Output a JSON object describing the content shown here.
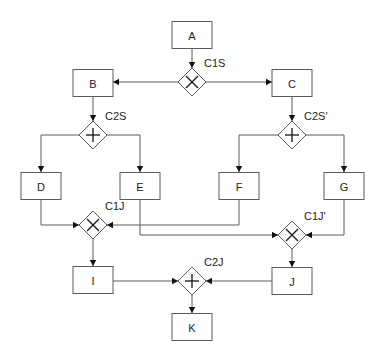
{
  "diagram": {
    "type": "process-flow",
    "colors": {
      "line": "#5a5a5a",
      "text": "#222222",
      "background": "#ffffff"
    },
    "tasks": [
      {
        "id": "A",
        "label": "A"
      },
      {
        "id": "B",
        "label": "B"
      },
      {
        "id": "C",
        "label": "C"
      },
      {
        "id": "D",
        "label": "D"
      },
      {
        "id": "E",
        "label": "E"
      },
      {
        "id": "F",
        "label": "F"
      },
      {
        "id": "G",
        "label": "G"
      },
      {
        "id": "I",
        "label": "I"
      },
      {
        "id": "J",
        "label": "J"
      },
      {
        "id": "K",
        "label": "K"
      }
    ],
    "gateways": [
      {
        "id": "C1S",
        "label": "C1S",
        "kind": "exclusive",
        "icon": "x-icon"
      },
      {
        "id": "C2S",
        "label": "C2S",
        "kind": "parallel",
        "icon": "plus-icon"
      },
      {
        "id": "C2S'",
        "label": "C2S'",
        "kind": "parallel",
        "icon": "plus-icon"
      },
      {
        "id": "C1J",
        "label": "C1J",
        "kind": "exclusive",
        "icon": "x-icon"
      },
      {
        "id": "C1J'",
        "label": "C1J'",
        "kind": "exclusive",
        "icon": "x-icon"
      },
      {
        "id": "C2J",
        "label": "C2J",
        "kind": "parallel",
        "icon": "plus-icon"
      }
    ],
    "edges": [
      {
        "from": "A",
        "to": "C1S"
      },
      {
        "from": "C1S",
        "to": "B"
      },
      {
        "from": "C1S",
        "to": "C"
      },
      {
        "from": "B",
        "to": "C2S"
      },
      {
        "from": "C2S",
        "to": "D"
      },
      {
        "from": "C2S",
        "to": "E"
      },
      {
        "from": "C",
        "to": "C2S'"
      },
      {
        "from": "C2S'",
        "to": "F"
      },
      {
        "from": "C2S'",
        "to": "G"
      },
      {
        "from": "D",
        "to": "C1J"
      },
      {
        "from": "F",
        "to": "C1J"
      },
      {
        "from": "E",
        "to": "C1J'"
      },
      {
        "from": "G",
        "to": "C1J'"
      },
      {
        "from": "C1J",
        "to": "I"
      },
      {
        "from": "C1J'",
        "to": "J"
      },
      {
        "from": "I",
        "to": "C2J"
      },
      {
        "from": "J",
        "to": "C2J"
      },
      {
        "from": "C2J",
        "to": "K"
      }
    ]
  }
}
